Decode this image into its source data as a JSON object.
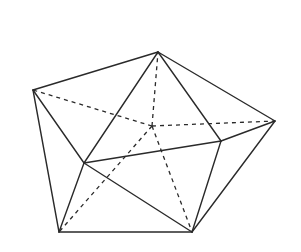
{
  "diagram": {
    "type": "polyhedron",
    "vertices": {
      "A": [
        158,
        52
      ],
      "B": [
        33,
        90
      ],
      "C": [
        275,
        121
      ],
      "D": [
        221,
        141
      ],
      "E": [
        84,
        163
      ],
      "F": [
        59,
        232
      ],
      "G": [
        192,
        232
      ],
      "O": [
        152,
        126
      ]
    },
    "solid_edges": [
      [
        "A",
        "B"
      ],
      [
        "A",
        "C"
      ],
      [
        "A",
        "E"
      ],
      [
        "A",
        "D"
      ],
      [
        "B",
        "E"
      ],
      [
        "B",
        "F"
      ],
      [
        "C",
        "D"
      ],
      [
        "C",
        "G"
      ],
      [
        "D",
        "E"
      ],
      [
        "D",
        "G"
      ],
      [
        "E",
        "F"
      ],
      [
        "E",
        "G"
      ],
      [
        "F",
        "G"
      ]
    ],
    "hidden_edges": [
      [
        "O",
        "A"
      ],
      [
        "O",
        "B"
      ],
      [
        "O",
        "C"
      ],
      [
        "O",
        "F"
      ],
      [
        "O",
        "G"
      ]
    ],
    "colors": {
      "stroke": "#2a2a2a",
      "background": "#ffffff"
    }
  }
}
